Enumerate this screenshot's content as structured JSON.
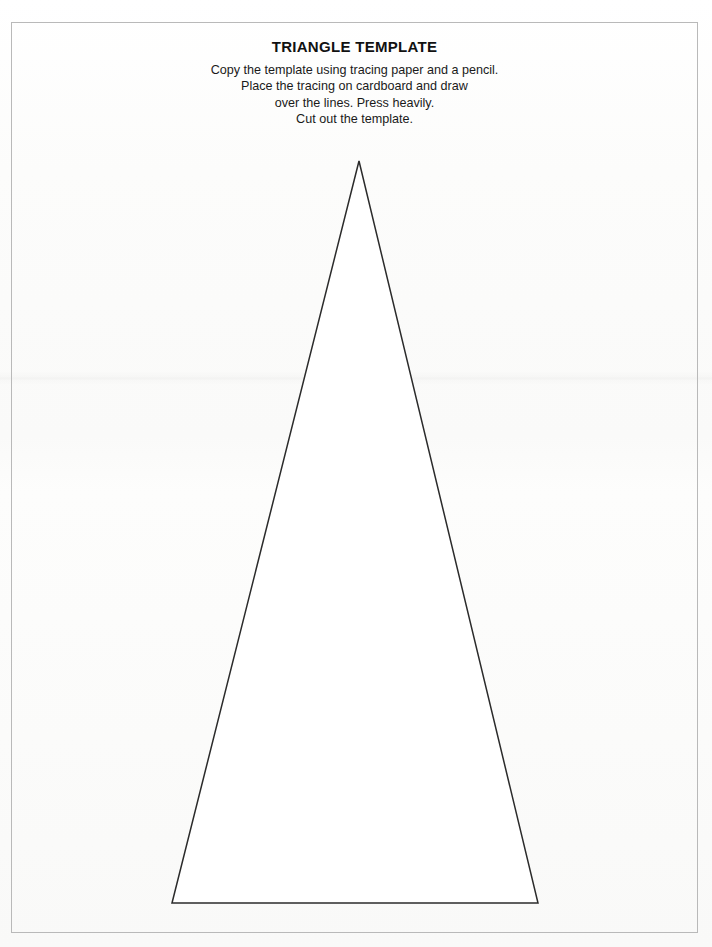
{
  "document": {
    "title": "TRIANGLE TEMPLATE",
    "instructions": [
      "Copy the template using tracing paper and a pencil.",
      "Place the tracing on cardboard and draw",
      "over the lines. Press heavily.",
      "Cut out the template."
    ]
  },
  "figure": {
    "name": "triangle-outline",
    "shape": "triangle",
    "stroke_color": "#2b2b2b",
    "fill_color": "#ffffff",
    "stroke_width": 1.5,
    "vertices": {
      "apex": {
        "x": 359,
        "y": 161
      },
      "base_left": {
        "x": 172,
        "y": 903
      },
      "base_right": {
        "x": 538,
        "y": 903
      }
    }
  },
  "page": {
    "width": 712,
    "height": 947,
    "background_color": "#fbfbfa",
    "border_color": "#b9b9b9"
  }
}
